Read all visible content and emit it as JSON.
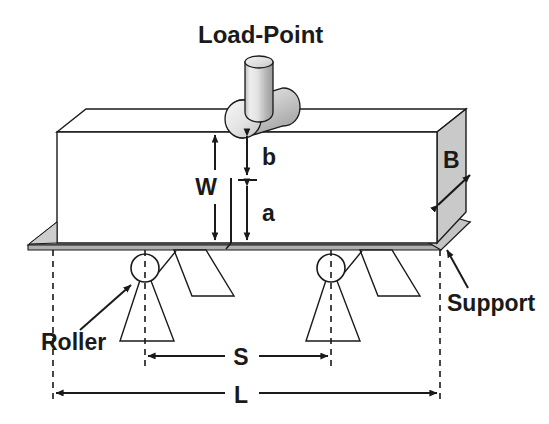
{
  "figure": {
    "type": "engineering-diagram",
    "labels": {
      "load_point": "Load-Point",
      "width_W": "W",
      "ligament_b": "b",
      "crack_a": "a",
      "thickness_B": "B",
      "span_S": "S",
      "length_L": "L",
      "roller": "Roller",
      "support": "Support"
    },
    "colors": {
      "line": "#1a1a1a",
      "face_shade": "#c9c9c9",
      "face_shade_light": "#d8d8d8",
      "plate_shade": "#bdbdbd",
      "cylinder_light": "#f2f2f2",
      "cylinder_mid": "#c4c4c4",
      "cylinder_dark": "#9a9a9a",
      "background": "#ffffff"
    },
    "elements": {
      "beam": "rectangular prism shown in isometric, front face white, right end face shaded",
      "load_cylinder": "vertical shaft cylinder meeting horizontal roller on beam top face",
      "rollers": "two circular rollers beneath beam on triangular/trapezoidal stands",
      "support_plate": "thin shaded plate beneath the beam extending to left and right",
      "notch": "vertical crack line rising from beam bottom face at mid-span"
    },
    "dimension_lines": [
      {
        "name": "W",
        "orientation": "vertical",
        "meaning": "full beam depth"
      },
      {
        "name": "b",
        "orientation": "vertical",
        "meaning": "uncracked ligament from notch tip to top"
      },
      {
        "name": "a",
        "orientation": "vertical",
        "meaning": "crack length from bottom to notch tip"
      },
      {
        "name": "B",
        "orientation": "diagonal",
        "meaning": "beam thickness on end face"
      },
      {
        "name": "S",
        "orientation": "horizontal",
        "meaning": "roller support span"
      },
      {
        "name": "L",
        "orientation": "horizontal",
        "meaning": "total beam length"
      }
    ]
  }
}
